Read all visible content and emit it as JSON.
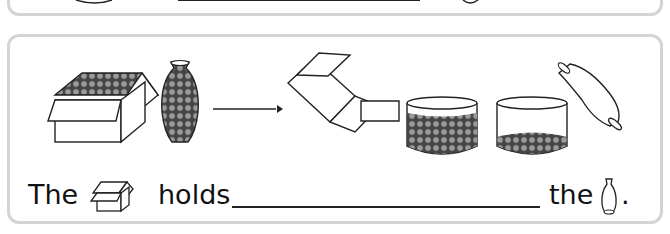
{
  "worksheet": {
    "top_panel": {
      "partial": true,
      "answer_blank": ""
    },
    "main_panel": {
      "illustration": {
        "before": [
          "box-full-of-marbles",
          "vase-full-of-marbles"
        ],
        "arrow": "right-arrow",
        "after": [
          "empty-box-tipped",
          "container-many-marbles",
          "container-few-marbles",
          "empty-vase-tipped"
        ]
      },
      "sentence": {
        "word_1": "The",
        "icon_1": "box-icon",
        "word_2": "holds",
        "answer_blank": "",
        "word_3": "the",
        "icon_2": "vase-icon",
        "punctuation": "."
      }
    }
  }
}
